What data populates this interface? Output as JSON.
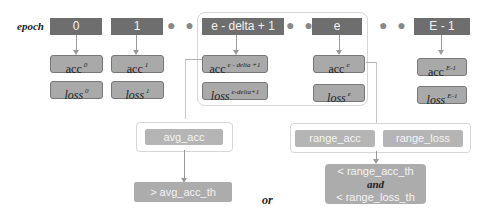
{
  "epoch_label": "epoch",
  "epochs": [
    {
      "label": "0",
      "acc": "acc",
      "acc_sup": "0",
      "loss": "loss",
      "loss_sup": "0"
    },
    {
      "label": "1",
      "acc": "acc",
      "acc_sup": "1",
      "loss": "loss",
      "loss_sup": "1"
    },
    {
      "label": "e - delta + 1",
      "acc": "acc",
      "acc_sup": "e - delta +1",
      "loss": "loss",
      "loss_sup": "e-delta+1"
    },
    {
      "label": "e",
      "acc": "acc",
      "acc_sup": "e",
      "loss": "loss",
      "loss_sup": "e"
    },
    {
      "label": "E - 1",
      "acc": "acc",
      "acc_sup": "E-1",
      "loss": "loss",
      "loss_sup": "E-1"
    }
  ],
  "ellipsis": "● ● ●",
  "avg": {
    "box": "avg_acc",
    "result": "> avg_acc_th"
  },
  "range": {
    "acc_box": "range_acc",
    "loss_box": "range_loss",
    "result_line1": "< range_acc_th",
    "result_and": "and",
    "result_line2": "< range_loss_th"
  },
  "or_label": "or",
  "colors": {
    "epoch_box": "#6e6e6e",
    "value_box": "#a9a9a9",
    "light_box": "#b5b5b5",
    "group_border": "#d6d6d6"
  }
}
